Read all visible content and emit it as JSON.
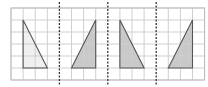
{
  "diagram": {
    "type": "grid-with-triangles",
    "grid": {
      "origin_x": 11,
      "origin_y": 8,
      "columns": 16,
      "rows": 6,
      "cell_width": 12.1,
      "cell_height": 12,
      "line_color": "#cfcfcf",
      "border_color": "#bdbdbd"
    },
    "dividers": {
      "style": "dashed",
      "color": "#333333",
      "columns": [
        4,
        8,
        12
      ]
    },
    "panels": [
      {
        "id": 1,
        "triangle": [
          [
            1,
            1
          ],
          [
            1,
            5
          ],
          [
            3,
            5
          ]
        ],
        "fill": "#f0f0f0",
        "stroke": "#555555",
        "description": "right triangle, vertical edge on left, light fill"
      },
      {
        "id": 2,
        "triangle": [
          [
            7,
            1
          ],
          [
            7,
            5
          ],
          [
            5,
            5
          ]
        ],
        "fill": "#c9c9c9",
        "stroke": "#555555",
        "description": "right triangle, vertical edge on right, gray fill"
      },
      {
        "id": 3,
        "triangle": [
          [
            9,
            1
          ],
          [
            9,
            5
          ],
          [
            11,
            5
          ]
        ],
        "fill": "#c9c9c9",
        "stroke": "#555555",
        "description": "right triangle, vertical edge on left, gray fill"
      },
      {
        "id": 4,
        "triangle": [
          [
            15,
            1
          ],
          [
            15,
            5
          ],
          [
            13,
            5
          ]
        ],
        "fill": "#c9c9c9",
        "stroke": "#555555",
        "description": "right triangle, vertical edge on right, gray fill"
      }
    ]
  }
}
